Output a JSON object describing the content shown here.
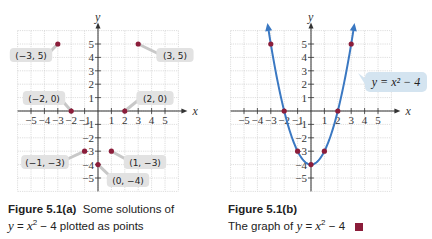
{
  "colors": {
    "grid": "#c8c8c8",
    "axis": "#333333",
    "point": "#8b1d3a",
    "curve": "#3a78c2",
    "label_bg": "#e2e2e2",
    "callout_bg": "#d4e4f0",
    "legend_square": "#8b1d3a"
  },
  "chart_data": [
    {
      "type": "scatter",
      "title": "Figure 5.1(a)",
      "subtitle": "Some solutions of y = x² − 4 plotted as points",
      "xlabel": "x",
      "ylabel": "y",
      "xlim": [
        -6,
        6
      ],
      "ylim": [
        -6,
        6
      ],
      "grid": true,
      "x_ticks": [
        -5,
        -4,
        -3,
        -2,
        -1,
        1,
        2,
        3,
        4,
        5
      ],
      "y_ticks": [
        -5,
        -4,
        -3,
        -2,
        -1,
        1,
        2,
        3,
        4,
        5
      ],
      "points": [
        {
          "x": -3,
          "y": 5,
          "label": "(−3, 5)"
        },
        {
          "x": 3,
          "y": 5,
          "label": "(3, 5)"
        },
        {
          "x": -2,
          "y": 0,
          "label": "(−2, 0)"
        },
        {
          "x": 2,
          "y": 0,
          "label": "(2, 0)"
        },
        {
          "x": -1,
          "y": -3,
          "label": "(−1, −3)"
        },
        {
          "x": 1,
          "y": -3,
          "label": "(1, −3)"
        },
        {
          "x": 0,
          "y": -4,
          "label": "(0, −4)"
        }
      ]
    },
    {
      "type": "line",
      "title": "Figure 5.1(b)",
      "subtitle": "The graph of y = x² − 4",
      "xlabel": "x",
      "ylabel": "y",
      "xlim": [
        -6,
        6
      ],
      "ylim": [
        -6,
        6
      ],
      "grid": true,
      "equation_label": "y = x² − 4",
      "x_ticks": [
        -5,
        -4,
        -3,
        -2,
        -1,
        1,
        2,
        3,
        4,
        5
      ],
      "y_ticks": [
        -5,
        -4,
        -3,
        -2,
        -1,
        1,
        2,
        3,
        4,
        5
      ],
      "series": [
        {
          "name": "y = x² − 4",
          "x": [
            -3,
            -2,
            -1,
            0,
            1,
            2,
            3
          ],
          "values": [
            5,
            0,
            -3,
            -4,
            -3,
            0,
            5
          ]
        }
      ],
      "marked_points": [
        {
          "x": -3,
          "y": 5
        },
        {
          "x": -2,
          "y": 0
        },
        {
          "x": -1,
          "y": -3
        },
        {
          "x": 0,
          "y": -4
        },
        {
          "x": 1,
          "y": -3
        },
        {
          "x": 2,
          "y": 0
        },
        {
          "x": 3,
          "y": 5
        }
      ]
    }
  ],
  "captions": {
    "a": {
      "fig": "Figure 5.1(a)",
      "text1": "Some solutions of",
      "eq_y": "y",
      "eq_eq": " = ",
      "eq_x": "x",
      "eq_sup": "2",
      "eq_rest": " − 4",
      "text2": " plotted as points"
    },
    "b": {
      "fig": "Figure 5.1(b)",
      "text1": "The graph of ",
      "eq_y": "y",
      "eq_eq": " = ",
      "eq_x": "x",
      "eq_sup": "2",
      "eq_rest": " − 4"
    }
  }
}
